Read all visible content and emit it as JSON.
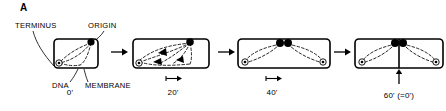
{
  "figure": {
    "panel_letter": "A",
    "caption_labels": {
      "terminus": "TERMINUS",
      "origin": "ORIGIN",
      "dna": "DNA",
      "membrane": "MEMBRANE"
    },
    "colors": {
      "ink": "#000000",
      "background": "#ffffff"
    },
    "stages": [
      {
        "id": "stage-0",
        "time_label": "0'",
        "description": "Single cell with unreplicated circular chromosome, origin attached to membrane at upper right, terminus at lower left",
        "origin_dots": 1,
        "terminus_marks": 1,
        "replication_forks": 0,
        "has_scale_bar": false,
        "has_septum": false,
        "has_division_arrow": false
      },
      {
        "id": "stage-20",
        "time_label": "20'",
        "description": "Replication initiated, two replication forks shown as solid triangles moving bidirectionally from the origin",
        "origin_dots": 1,
        "terminus_marks": 1,
        "replication_forks": 3,
        "has_scale_bar": true,
        "has_septum": false,
        "has_division_arrow": false
      },
      {
        "id": "stage-40",
        "time_label": "40'",
        "description": "Elongated cell, two origins attached side by side at membrane, two chromosome copies with two termini",
        "origin_dots": 2,
        "terminus_marks": 2,
        "replication_forks": 0,
        "has_scale_bar": true,
        "has_septum": false,
        "has_division_arrow": false
      },
      {
        "id": "stage-60",
        "time_label": "60' (=0')",
        "description": "Septum forms between the two origins, cell divides into two daughter cells each with one chromosome",
        "origin_dots": 2,
        "terminus_marks": 2,
        "replication_forks": 0,
        "has_scale_bar": false,
        "has_septum": true,
        "has_division_arrow": true
      }
    ],
    "flow_arrows": [
      {
        "id": "flow-arrow-1",
        "from": "stage-0",
        "to": "stage-20"
      },
      {
        "id": "flow-arrow-2",
        "from": "stage-20",
        "to": "stage-40"
      },
      {
        "id": "flow-arrow-3",
        "from": "stage-40",
        "to": "stage-60"
      }
    ]
  }
}
